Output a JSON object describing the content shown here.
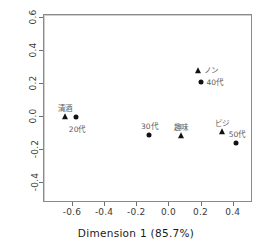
{
  "chart_data": {
    "type": "scatter",
    "title": "",
    "xlabel": "Dimension 1  (85.7%)",
    "ylabel": "Dimension 2  (14.1%)",
    "xlim": [
      -0.78,
      0.52
    ],
    "ylim": [
      -0.52,
      0.62
    ],
    "xticks": [
      "-0.6",
      "-0.4",
      "-0.2",
      "0.0",
      "0.2",
      "0.4"
    ],
    "xtickvalues": [
      -0.6,
      -0.4,
      -0.2,
      0.0,
      0.2,
      0.4
    ],
    "yticks": [
      "-0.4",
      "-0.2",
      "0.0",
      "0.2",
      "0.4",
      "0.6"
    ],
    "ytickvalues": [
      -0.4,
      -0.2,
      0.0,
      0.2,
      0.4,
      0.6
    ],
    "grid": false,
    "zero_lines": true,
    "legend": "none",
    "series": [
      {
        "name": "columns",
        "marker": "triangle",
        "color": "#121212",
        "points": [
          {
            "label": "清酒",
            "x": -0.65,
            "y": 0.0,
            "label_dx": 0,
            "label_dy": -10
          },
          {
            "label": "ノン",
            "x": 0.18,
            "y": 0.28,
            "label_dx": 13,
            "label_dy": -2
          },
          {
            "label": "趣味",
            "x": 0.07,
            "y": -0.115,
            "label_dx": 0,
            "label_dy": -10
          },
          {
            "label": "ビジ",
            "x": 0.33,
            "y": -0.09,
            "label_dx": 0,
            "label_dy": -10
          }
        ]
      },
      {
        "name": "rows",
        "marker": "circle",
        "color": "#121212",
        "points": [
          {
            "label": "20代",
            "x": -0.58,
            "y": 0.0,
            "label_dx": 1,
            "label_dy": 11
          },
          {
            "label": "40代",
            "x": 0.195,
            "y": 0.215,
            "label_dx": 14,
            "label_dy": -1
          },
          {
            "label": "30代",
            "x": -0.125,
            "y": -0.11,
            "label_dx": 0,
            "label_dy": -10
          },
          {
            "label": "50代",
            "x": 0.415,
            "y": -0.155,
            "label_dx": 1,
            "label_dy": -10
          }
        ]
      }
    ]
  }
}
